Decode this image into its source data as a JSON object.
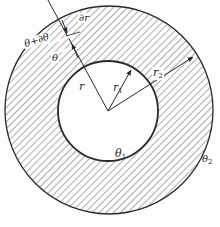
{
  "diagram": {
    "type": "annular-cylinder-cross-section",
    "colors": {
      "stroke": "#2a2a2a",
      "hatch": "#6a6a6a",
      "background": "#fdfdfd"
    },
    "outer_circle": {
      "cx": 109,
      "cy": 110,
      "r": 104
    },
    "inner_circle": {
      "cx": 108,
      "cy": 111,
      "r": 50
    },
    "labels": {
      "r": "r",
      "r1_base": "r",
      "r1_sub": "1",
      "r2_base": "r",
      "r2_sub": "2",
      "theta": "θ",
      "theta_plus_dtheta": "θ+∂θ",
      "dr": "∂r",
      "theta1_base": "θ",
      "theta1_sub": "1",
      "theta2_base": "θ",
      "theta2_sub": "2"
    }
  }
}
